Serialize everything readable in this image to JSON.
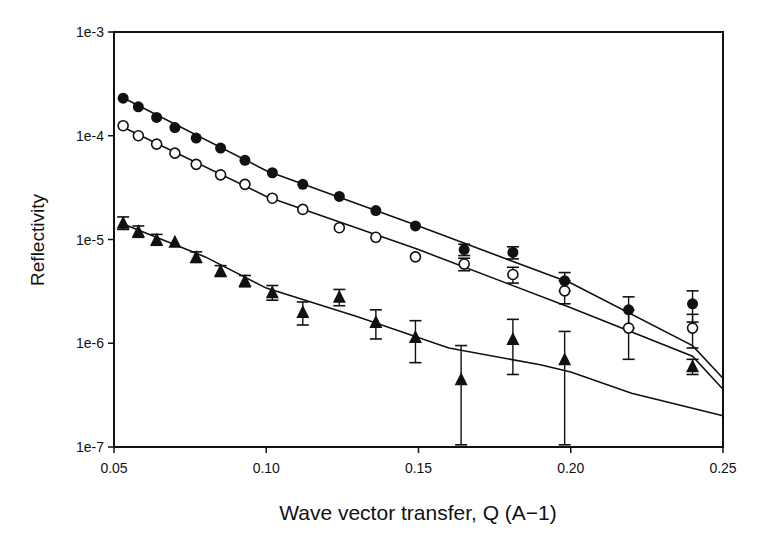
{
  "chart_data": {
    "type": "scatter",
    "title": "",
    "xlabel": "Wave vector transfer, Q (A−1)",
    "ylabel": "Reflectivity",
    "xlim": [
      0.05,
      0.25
    ],
    "ylim": [
      1e-07,
      0.001
    ],
    "yscale": "log",
    "grid": false,
    "legend": null,
    "x_ticks": [
      "0.05",
      "0.10",
      "0.15",
      "0.20",
      "0.25"
    ],
    "y_ticks": [
      "1e-3",
      "1e-4",
      "1e-5",
      "1e-6",
      "1e-7"
    ],
    "series": [
      {
        "name": "filled circles",
        "marker": "filled-circle",
        "x": [
          0.053,
          0.058,
          0.064,
          0.07,
          0.077,
          0.085,
          0.093,
          0.102,
          0.112,
          0.124,
          0.136,
          0.149,
          0.165,
          0.181,
          0.198,
          0.219,
          0.24
        ],
        "y": [
          0.00023,
          0.00019,
          0.00015,
          0.00012,
          9.5e-05,
          7.6e-05,
          5.8e-05,
          4.4e-05,
          3.4e-05,
          2.6e-05,
          1.9e-05,
          1.35e-05,
          8e-06,
          7.5e-06,
          4e-06,
          2.1e-06,
          2.4e-06
        ],
        "yerr": [
          0,
          0,
          0,
          0,
          0,
          0,
          0,
          0,
          0,
          0,
          0,
          0,
          1e-06,
          1e-06,
          8e-07,
          7e-07,
          8e-07
        ]
      },
      {
        "name": "open circles",
        "marker": "open-circle",
        "x": [
          0.053,
          0.058,
          0.064,
          0.07,
          0.077,
          0.085,
          0.093,
          0.102,
          0.112,
          0.124,
          0.136,
          0.149,
          0.165,
          0.181,
          0.198,
          0.219,
          0.24
        ],
        "y": [
          0.000125,
          0.0001,
          8.3e-05,
          6.8e-05,
          5.3e-05,
          4.2e-05,
          3.4e-05,
          2.5e-05,
          1.95e-05,
          1.3e-05,
          1.05e-05,
          6.8e-06,
          5.8e-06,
          4.6e-06,
          3.2e-06,
          1.4e-06,
          1.4e-06
        ],
        "yerr": [
          0,
          0,
          0,
          0,
          0,
          0,
          0,
          0,
          0,
          0,
          0,
          0,
          8e-07,
          8e-07,
          8e-07,
          7e-07,
          5e-07
        ]
      },
      {
        "name": "filled triangles",
        "marker": "filled-triangle",
        "x": [
          0.053,
          0.058,
          0.064,
          0.07,
          0.077,
          0.085,
          0.093,
          0.102,
          0.112,
          0.124,
          0.136,
          0.149,
          0.164,
          0.181,
          0.198,
          0.24
        ],
        "y": [
          1.45e-05,
          1.2e-05,
          1e-05,
          9.5e-06,
          6.8e-06,
          5e-06,
          4e-06,
          3.1e-06,
          2e-06,
          2.8e-06,
          1.6e-06,
          1.15e-06,
          4.5e-07,
          1.1e-06,
          7e-07,
          6e-07
        ],
        "yerr": [
          2e-06,
          1.5e-06,
          1.2e-06,
          0,
          8e-07,
          6e-07,
          5e-07,
          5e-07,
          5e-07,
          5e-07,
          5e-07,
          5e-07,
          5e-07,
          6e-07,
          6e-07,
          1e-07
        ]
      }
    ],
    "fit_lines": [
      {
        "name": "fit filled circles",
        "x": [
          0.052,
          0.1,
          0.15,
          0.2,
          0.24,
          0.25
        ],
        "y": [
          0.00024,
          4.6e-05,
          1.35e-05,
          3.8e-06,
          9.5e-07,
          4.6e-07
        ]
      },
      {
        "name": "fit open circles",
        "x": [
          0.052,
          0.1,
          0.15,
          0.2,
          0.24,
          0.25
        ],
        "y": [
          0.000125,
          2.6e-05,
          8e-06,
          2.2e-06,
          7.5e-07,
          3.6e-07
        ]
      },
      {
        "name": "fit triangles",
        "x": [
          0.052,
          0.08,
          0.1,
          0.13,
          0.16,
          0.19,
          0.2,
          0.22,
          0.25
        ],
        "y": [
          1.45e-05,
          6.8e-06,
          3.4e-06,
          1.8e-06,
          9e-07,
          6.2e-07,
          5.3e-07,
          3.3e-07,
          2e-07
        ]
      }
    ]
  }
}
